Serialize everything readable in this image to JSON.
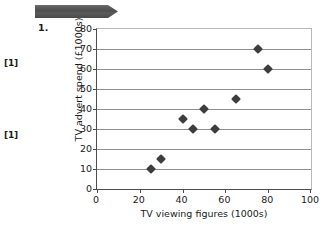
{
  "banner": {
    "icon": "arrow-banner",
    "color": "#545454"
  },
  "question": {
    "number": "1.",
    "marks": [
      {
        "label": "[1]"
      },
      {
        "label": "[1]"
      }
    ]
  },
  "chart_data": {
    "type": "scatter",
    "title": "",
    "xlabel": "TV viewing figures (1000s)",
    "ylabel": "TV advert spend (£1000s)",
    "xlim": [
      0,
      100
    ],
    "ylim": [
      0,
      80
    ],
    "xticks": [
      0,
      20,
      40,
      60,
      80,
      100
    ],
    "yticks": [
      0,
      10,
      20,
      30,
      40,
      50,
      60,
      70,
      80
    ],
    "grid": "horizontal",
    "legend": "none",
    "marker": "diamond",
    "marker_color": "#3d3d3d",
    "points": [
      {
        "x": 25,
        "y": 10
      },
      {
        "x": 30,
        "y": 15
      },
      {
        "x": 40,
        "y": 35
      },
      {
        "x": 45,
        "y": 30
      },
      {
        "x": 50,
        "y": 40
      },
      {
        "x": 55,
        "y": 30
      },
      {
        "x": 65,
        "y": 45
      },
      {
        "x": 75,
        "y": 70
      },
      {
        "x": 80,
        "y": 60
      }
    ]
  }
}
